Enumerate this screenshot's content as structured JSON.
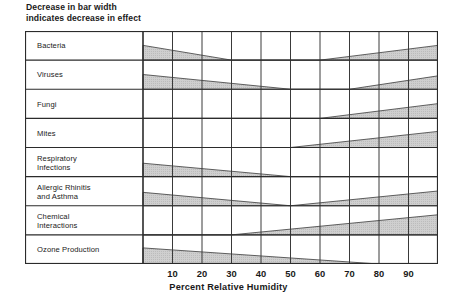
{
  "title": "Decrease in bar width\nindicates decrease in effect",
  "axis": {
    "x_label": "Percent Relative Humidity",
    "ticks": [
      10,
      20,
      30,
      40,
      50,
      60,
      70,
      80,
      90
    ]
  },
  "colors": {
    "bar_fill": "#c8c8c8",
    "bar_stroke": "#4d4d4d",
    "grid": "#3a3a3a",
    "frame": "#2b2b2b",
    "text": "#1a1a1a"
  },
  "chart_data": {
    "type": "area",
    "title": "Decrease in bar width indicates decrease in effect",
    "xlabel": "Percent Relative Humidity",
    "ylabel": "",
    "xlim": [
      0,
      100
    ],
    "grid": true,
    "legend": "none",
    "note": "Each row is a horizontal tapered band; band thickness encodes relative magnitude of effect at that humidity. Thickness given as fraction of row height at each humidity breakpoint.",
    "categories": [
      "Bacteria",
      "Viruses",
      "Fungi",
      "Mites",
      "Respiratory Infections",
      "Allergic Rhinitis and Asthma",
      "Chemical Interactions",
      "Ozone Production"
    ],
    "series": [
      {
        "name": "Bacteria",
        "x": [
          0,
          30,
          60,
          100
        ],
        "values": [
          0.55,
          0.0,
          0.0,
          0.55
        ]
      },
      {
        "name": "Viruses",
        "x": [
          0,
          50,
          70,
          100
        ],
        "values": [
          0.55,
          0.0,
          0.0,
          0.5
        ]
      },
      {
        "name": "Fungi",
        "x": [
          0,
          60,
          100
        ],
        "values": [
          0.0,
          0.0,
          0.55
        ]
      },
      {
        "name": "Mites",
        "x": [
          0,
          50,
          100
        ],
        "values": [
          0.0,
          0.0,
          0.6
        ]
      },
      {
        "name": "Respiratory Infections",
        "x": [
          0,
          50,
          100
        ],
        "values": [
          0.5,
          0.0,
          0.0
        ]
      },
      {
        "name": "Allergic Rhinitis and Asthma",
        "x": [
          0,
          50,
          100
        ],
        "values": [
          0.5,
          0.0,
          0.55
        ]
      },
      {
        "name": "Chemical Interactions",
        "x": [
          0,
          30,
          100
        ],
        "values": [
          0.0,
          0.0,
          0.75
        ]
      },
      {
        "name": "Ozone Production",
        "x": [
          0,
          80,
          100
        ],
        "values": [
          0.6,
          0.0,
          0.0
        ]
      }
    ]
  },
  "rows": [
    {
      "label": "Bacteria",
      "line1": "Bacteria",
      "line2": ""
    },
    {
      "label": "Viruses",
      "line1": "Viruses",
      "line2": ""
    },
    {
      "label": "Fungi",
      "line1": "Fungi",
      "line2": ""
    },
    {
      "label": "Mites",
      "line1": "Mites",
      "line2": ""
    },
    {
      "label": "Respiratory Infections",
      "line1": "Respiratory",
      "line2": "Infections"
    },
    {
      "label": "Allergic Rhinitis and Asthma",
      "line1": "Allergic Rhinitis",
      "line2": "and Asthma"
    },
    {
      "label": "Chemical Interactions",
      "line1": "Chemical",
      "line2": "Interactions"
    },
    {
      "label": "Ozone Production",
      "line1": "Ozone Production",
      "line2": ""
    }
  ]
}
